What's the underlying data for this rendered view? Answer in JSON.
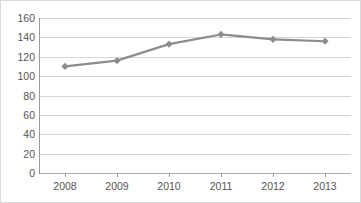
{
  "chart_data": {
    "type": "line",
    "title": "",
    "subtitle": "",
    "xlabel": "",
    "ylabel": "",
    "categories": [
      "2008",
      "2009",
      "2010",
      "2011",
      "2012",
      "2013"
    ],
    "x": [
      2008,
      2009,
      2010,
      2011,
      2012,
      2013
    ],
    "values": [
      110,
      116,
      133,
      143,
      138,
      136
    ],
    "series": [
      {
        "name": "",
        "values": [
          110,
          116,
          133,
          143,
          138,
          136
        ],
        "color": "#8c8c8c",
        "marker": "diamond"
      }
    ],
    "ylim": [
      0,
      160
    ],
    "yticks": [
      0,
      20,
      40,
      60,
      80,
      100,
      120,
      140,
      160
    ],
    "ytick_labels": [
      "0",
      "20",
      "40",
      "60",
      "80",
      "100",
      "120",
      "140",
      "160"
    ],
    "xtick_labels": [
      "2008",
      "2009",
      "2010",
      "2011",
      "2012",
      "2013"
    ],
    "grid": "horizontal",
    "legend": "none",
    "colors": {
      "series": "#8c8c8c",
      "gridline": "#d5d5d5",
      "axis": "#9a9a9a",
      "tick_text": "#555555",
      "background": "#ffffff",
      "border": "#d9d9d9"
    }
  }
}
